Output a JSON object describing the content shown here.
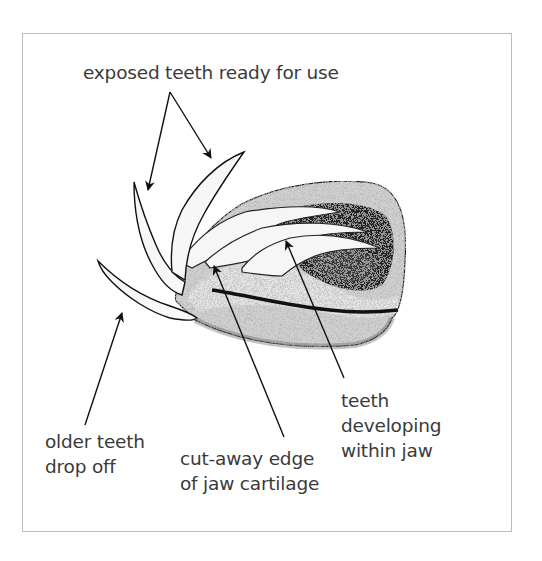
{
  "diagram": {
    "labels": {
      "exposed_teeth": {
        "lines": [
          "exposed teeth ready for use"
        ]
      },
      "older_teeth": {
        "lines": [
          "older teeth",
          "drop off"
        ]
      },
      "jaw_cartilage": {
        "lines": [
          "cut-away edge",
          "of jaw cartilage"
        ]
      },
      "developing_teeth": {
        "lines": [
          "teeth",
          "developing",
          "within jaw"
        ]
      }
    },
    "colors": {
      "frame_border": "#bdbdbd",
      "text": "#3a3a3a",
      "ink": "#111111",
      "stipple_light": "#c9c9c9",
      "stipple_mid": "#9a9a9a",
      "stipple_dark": "#2a2a2a"
    }
  }
}
